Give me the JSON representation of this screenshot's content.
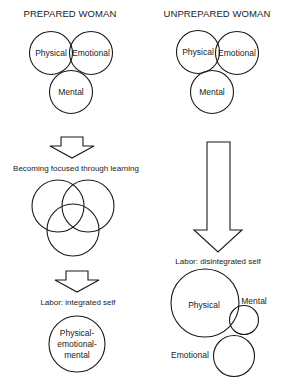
{
  "prepared": {
    "title": "PREPARED WOMAN",
    "circles": {
      "physical": "Physical",
      "emotional": "Emotional",
      "mental": "Mental"
    },
    "step_caption": "Becoming focused through learning",
    "labor_caption": "Labor:  integrated self",
    "integrated_label": [
      "Physical-",
      "emotional-",
      "mental"
    ]
  },
  "unprepared": {
    "title": "UNPREPARED WOMAN",
    "circles": {
      "physical": "Physical",
      "emotional": "Emotional",
      "mental": "Mental"
    },
    "labor_caption": "Labor:  disintegrated self",
    "disintegrated": {
      "physical": "Physical",
      "mental": "Mental",
      "emotional": "Emotional"
    }
  }
}
